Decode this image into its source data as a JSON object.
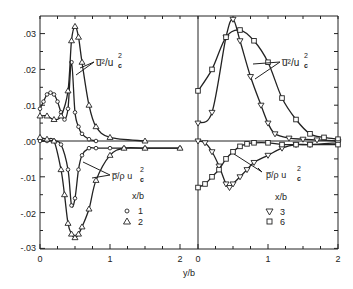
{
  "chart_data": [
    {
      "type": "line",
      "panel": "left",
      "xlabel": "y/b",
      "ylabel": "",
      "xlim": [
        0,
        2
      ],
      "ylim": [
        -0.03,
        0.035
      ],
      "y_ticks": [
        ".03",
        ".02",
        ".01",
        ".00",
        "-.01",
        "-.02",
        "-.03"
      ],
      "x_ticks": [
        "0",
        "1",
        "2"
      ],
      "legend": {
        "title": "x/b",
        "entries": [
          {
            "marker": "circle",
            "label": "1"
          },
          {
            "marker": "triangle-up",
            "label": "2"
          }
        ]
      },
      "annotations": [
        "u̅²/u_c²",
        "p̅/ρ u_c²"
      ],
      "series": [
        {
          "name": "u2/uc2 x/b=1",
          "marker": "circle",
          "x": [
            0,
            0.05,
            0.1,
            0.15,
            0.2,
            0.25,
            0.3,
            0.35,
            0.4,
            0.45,
            0.5,
            0.55,
            0.6,
            0.7,
            0.8
          ],
          "y": [
            0.009,
            0.011,
            0.013,
            0.0135,
            0.013,
            0.011,
            0.008,
            0.006,
            0.009,
            0.022,
            0.008,
            0.004,
            0.002,
            0.0005,
            0.0
          ]
        },
        {
          "name": "u2/uc2 x/b=2",
          "marker": "triangle-up",
          "x": [
            0,
            0.1,
            0.2,
            0.3,
            0.4,
            0.45,
            0.5,
            0.55,
            0.6,
            0.7,
            0.8,
            1.0,
            1.5
          ],
          "y": [
            0.007,
            0.007,
            0.006,
            0.007,
            0.014,
            0.028,
            0.032,
            0.029,
            0.022,
            0.01,
            0.004,
            0.001,
            0.0
          ]
        },
        {
          "name": "p/rho uc2 x/b=1",
          "marker": "circle",
          "x": [
            0,
            0.1,
            0.2,
            0.3,
            0.4,
            0.45,
            0.5,
            0.55,
            0.6,
            0.7,
            0.8,
            1.0,
            1.2,
            1.5,
            2.0
          ],
          "y": [
            0.0,
            0.0,
            0.0,
            -0.001,
            -0.008,
            -0.018,
            -0.016,
            -0.008,
            -0.004,
            -0.002,
            -0.002,
            -0.002,
            -0.002,
            -0.002,
            -0.002
          ]
        },
        {
          "name": "p/rho uc2 x/b=2",
          "marker": "triangle-up",
          "x": [
            0,
            0.1,
            0.2,
            0.3,
            0.35,
            0.4,
            0.45,
            0.5,
            0.55,
            0.6,
            0.7,
            0.8,
            1.0,
            1.2,
            1.5,
            2.0
          ],
          "y": [
            0.001,
            0.0005,
            0.0,
            -0.008,
            -0.015,
            -0.023,
            -0.026,
            -0.027,
            -0.026,
            -0.024,
            -0.019,
            -0.011,
            -0.004,
            -0.002,
            -0.002,
            -0.002
          ]
        }
      ]
    },
    {
      "type": "line",
      "panel": "right",
      "xlabel": "y/b",
      "xlim": [
        0,
        2
      ],
      "ylim": [
        -0.03,
        0.035
      ],
      "x_ticks": [
        "0",
        "1",
        "2"
      ],
      "legend": {
        "title": "x/b",
        "entries": [
          {
            "marker": "triangle-down",
            "label": "3"
          },
          {
            "marker": "square",
            "label": "6"
          }
        ]
      },
      "annotations": [
        "u̅²/u_c²",
        "p̅/ρ u_c²"
      ],
      "series": [
        {
          "name": "u2/uc2 x/b=3",
          "marker": "triangle-down",
          "x": [
            0,
            0.2,
            0.4,
            0.5,
            0.6,
            0.75,
            0.9,
            1.0,
            1.1,
            1.3,
            1.5,
            1.7,
            2.0
          ],
          "y": [
            0.005,
            0.008,
            0.029,
            0.034,
            0.028,
            0.018,
            0.01,
            0.005,
            0.002,
            0.0008,
            0.0005,
            0.0003,
            0.0
          ]
        },
        {
          "name": "u2/uc2 x/b=6",
          "marker": "square",
          "x": [
            0,
            0.2,
            0.4,
            0.6,
            0.8,
            1.0,
            1.2,
            1.4,
            1.6,
            1.8,
            2.0
          ],
          "y": [
            0.014,
            0.02,
            0.029,
            0.031,
            0.028,
            0.022,
            0.012,
            0.006,
            0.002,
            0.001,
            0.0005
          ]
        },
        {
          "name": "p/rho uc2 x/b=3",
          "marker": "triangle-down",
          "x": [
            0,
            0.1,
            0.2,
            0.3,
            0.4,
            0.45,
            0.5,
            0.6,
            0.7,
            0.8,
            1.0,
            1.2,
            1.4,
            1.6,
            2.0
          ],
          "y": [
            0.0,
            -0.0005,
            -0.003,
            -0.007,
            -0.012,
            -0.013,
            -0.012,
            -0.01,
            -0.008,
            -0.006,
            -0.004,
            -0.002,
            -0.001,
            -0.001,
            -0.0005
          ]
        },
        {
          "name": "p/rho uc2 x/b=6",
          "marker": "square",
          "x": [
            0,
            0.1,
            0.2,
            0.3,
            0.4,
            0.5,
            0.6,
            0.7,
            0.8,
            1.0,
            1.2,
            1.4,
            1.6,
            2.0
          ],
          "y": [
            -0.013,
            -0.012,
            -0.01,
            -0.008,
            -0.005,
            -0.003,
            -0.0015,
            -0.0008,
            -0.0005,
            -0.0005,
            -0.001,
            -0.001,
            -0.001,
            -0.001
          ]
        }
      ]
    }
  ],
  "labels": {
    "xlabel": "y/b",
    "y_ticks": [
      ".03",
      ".02",
      ".01",
      ".00",
      "-.01",
      "-.02",
      "-.03"
    ],
    "left_x_ticks": [
      "0",
      "1",
      "2"
    ],
    "right_x_ticks": [
      "0",
      "1",
      "2"
    ],
    "u_label_left": "u̅²/u",
    "u_label_right": "u̅²/u",
    "p_label_left": "p̅/ρ u",
    "p_label_right": "p̅/ρ u",
    "sub_c": "c",
    "sup_2": "2",
    "legend_left_title": "x/b",
    "legend_left_1": "1",
    "legend_left_2": "2",
    "legend_right_title": "x/b",
    "legend_right_3": "3",
    "legend_right_6": "6"
  }
}
